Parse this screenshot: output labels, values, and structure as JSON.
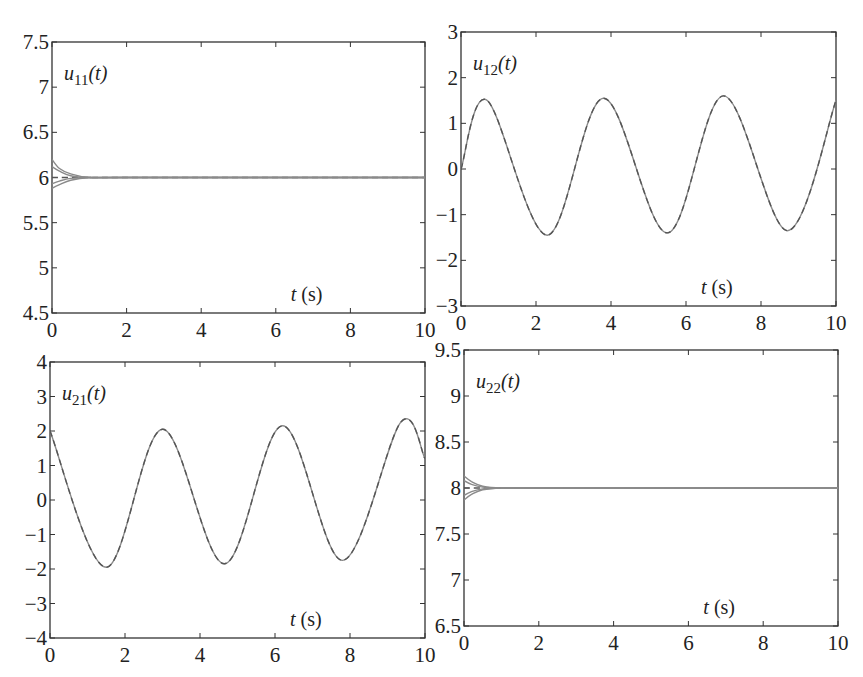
{
  "chart_data": [
    {
      "type": "line",
      "panel": "top-left",
      "title": "",
      "label": "u11(t)",
      "label_main": "u",
      "label_sub": "11",
      "label_arg": "(t)",
      "xlabel": "t (s)",
      "ylabel": "",
      "xlim": [
        0,
        10
      ],
      "ylim": [
        4.5,
        7.5
      ],
      "xticks": [
        "0",
        "2",
        "4",
        "6",
        "8",
        "10"
      ],
      "yticks": [
        "4.5",
        "5",
        "5.5",
        "6",
        "6.5",
        "7",
        "7.5"
      ],
      "grid": false,
      "description": "Multiple solid gray trajectories starting between ~5.88 and ~6.2 at t=0, converging by t≈1 s onto a dashed reference at ~6.0 that stays constant to t=10.",
      "series": [
        {
          "name": "reference (dashed)",
          "x": [
            0,
            1,
            2,
            4,
            6,
            8,
            10
          ],
          "values": [
            6.0,
            6.0,
            6.0,
            6.0,
            6.0,
            6.0,
            6.0
          ]
        },
        {
          "name": "trajectory 1",
          "x": [
            0,
            0.2,
            0.5,
            1.0,
            2,
            10
          ],
          "values": [
            6.2,
            6.1,
            6.04,
            6.0,
            6.0,
            6.0
          ]
        },
        {
          "name": "trajectory 2",
          "x": [
            0,
            0.2,
            0.5,
            1.0,
            2,
            10
          ],
          "values": [
            6.12,
            6.07,
            6.02,
            6.0,
            6.0,
            6.0
          ]
        },
        {
          "name": "trajectory 3",
          "x": [
            0,
            0.2,
            0.5,
            1.0,
            2,
            10
          ],
          "values": [
            5.93,
            5.96,
            5.99,
            6.0,
            6.0,
            6.0
          ]
        },
        {
          "name": "trajectory 4",
          "x": [
            0,
            0.2,
            0.5,
            1.0,
            2,
            10
          ],
          "values": [
            5.88,
            5.92,
            5.97,
            6.0,
            6.0,
            6.0
          ]
        }
      ]
    },
    {
      "type": "line",
      "panel": "top-right",
      "title": "",
      "label": "u12(t)",
      "label_main": "u",
      "label_sub": "12",
      "label_arg": "(t)",
      "xlabel": "t (s)",
      "ylabel": "",
      "xlim": [
        0,
        10
      ],
      "ylim": [
        -3,
        3
      ],
      "xticks": [
        "0",
        "2",
        "4",
        "6",
        "8",
        "10"
      ],
      "yticks": [
        "-3",
        "-2",
        "-1",
        "0",
        "1",
        "2",
        "3"
      ],
      "grid": false,
      "description": "Oscillating solid trajectories overlapping a dashed reference; starts near 0 at t=0, period ~3.15 s.",
      "series": [
        {
          "name": "reference (dashed) / trajectories",
          "x": [
            0,
            0.7,
            2.3,
            3.8,
            5.5,
            7.0,
            8.7,
            10
          ],
          "values": [
            0.0,
            1.5,
            -1.45,
            1.55,
            -1.4,
            1.6,
            -1.35,
            1.5
          ]
        }
      ]
    },
    {
      "type": "line",
      "panel": "bottom-left",
      "title": "",
      "label": "u21(t)",
      "label_main": "u",
      "label_sub": "21",
      "label_arg": "(t)",
      "xlabel": "t (s)",
      "ylabel": "",
      "xlim": [
        0,
        10
      ],
      "ylim": [
        -4,
        4
      ],
      "xticks": [
        "0",
        "2",
        "4",
        "6",
        "8",
        "10"
      ],
      "yticks": [
        "-4",
        "-3",
        "-2",
        "-1",
        "0",
        "1",
        "2",
        "3",
        "4"
      ],
      "grid": false,
      "description": "Oscillating solid trajectories overlapping a dashed reference; starts near 2 at t=0, period ~3.15 s.",
      "series": [
        {
          "name": "reference (dashed) / trajectories",
          "x": [
            0,
            1.5,
            3.0,
            4.65,
            6.2,
            7.8,
            9.35,
            10
          ],
          "values": [
            2.0,
            -1.95,
            2.05,
            -1.85,
            2.15,
            -1.75,
            2.25,
            1.2
          ]
        }
      ]
    },
    {
      "type": "line",
      "panel": "bottom-right",
      "title": "",
      "label": "u22(t)",
      "label_main": "u",
      "label_sub": "22",
      "label_arg": "(t)",
      "xlabel": "t (s)",
      "ylabel": "",
      "xlim": [
        0,
        10
      ],
      "ylim": [
        6.5,
        9.5
      ],
      "xticks": [
        "0",
        "2",
        "4",
        "6",
        "8",
        "10"
      ],
      "yticks": [
        "6.5",
        "7",
        "7.5",
        "8",
        "8.5",
        "9",
        "9.5"
      ],
      "grid": false,
      "description": "Multiple solid gray trajectories starting between ~7.87 and ~8.13 at t=0, converging by t≈1 s onto a dashed reference at ~8.0.",
      "series": [
        {
          "name": "reference (dashed)",
          "x": [
            0,
            1,
            2,
            4,
            6,
            8,
            10
          ],
          "values": [
            8.0,
            8.0,
            8.0,
            8.0,
            8.0,
            8.0,
            8.0
          ]
        },
        {
          "name": "trajectory 1",
          "x": [
            0,
            0.2,
            0.5,
            1.0,
            2,
            10
          ],
          "values": [
            8.13,
            8.07,
            8.02,
            8.0,
            8.0,
            8.0
          ]
        },
        {
          "name": "trajectory 2",
          "x": [
            0,
            0.2,
            0.5,
            1.0,
            2,
            10
          ],
          "values": [
            8.08,
            8.04,
            8.01,
            8.0,
            8.0,
            8.0
          ]
        },
        {
          "name": "trajectory 3",
          "x": [
            0,
            0.2,
            0.5,
            1.0,
            2,
            10
          ],
          "values": [
            7.92,
            7.96,
            7.99,
            8.0,
            8.0,
            8.0
          ]
        },
        {
          "name": "trajectory 4",
          "x": [
            0,
            0.2,
            0.5,
            1.0,
            2,
            10
          ],
          "values": [
            7.87,
            7.93,
            7.98,
            8.0,
            8.0,
            8.0
          ]
        }
      ]
    }
  ]
}
